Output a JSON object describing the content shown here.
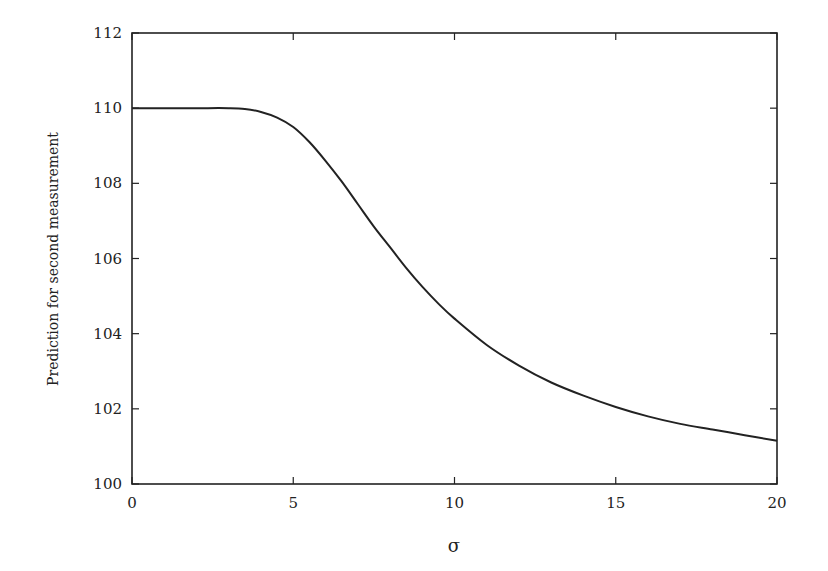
{
  "chart_data": {
    "type": "line",
    "title": "",
    "xlabel": "σ",
    "ylabel": "Prediction for second measurement",
    "xlim": [
      0,
      20
    ],
    "ylim": [
      100,
      112
    ],
    "xticks": [
      0,
      5,
      10,
      15,
      20
    ],
    "yticks": [
      100,
      102,
      104,
      106,
      108,
      110,
      112
    ],
    "grid": false,
    "legend": null,
    "series": [
      {
        "name": "prediction",
        "color": "#222222",
        "x": [
          0,
          1,
          2,
          3,
          3.5,
          4,
          4.5,
          5,
          5.5,
          6,
          6.5,
          7,
          7.5,
          8,
          8.5,
          9,
          9.5,
          10,
          11,
          12,
          13,
          14,
          15,
          16,
          17,
          18,
          19,
          20
        ],
        "y": [
          110,
          110,
          110,
          110,
          109.98,
          109.9,
          109.75,
          109.5,
          109.1,
          108.6,
          108.05,
          107.45,
          106.85,
          106.3,
          105.75,
          105.25,
          104.8,
          104.4,
          103.7,
          103.15,
          102.7,
          102.35,
          102.05,
          101.8,
          101.6,
          101.45,
          101.3,
          101.15
        ]
      }
    ]
  }
}
